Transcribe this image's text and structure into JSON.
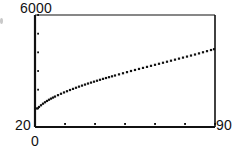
{
  "figure": {
    "name": "scatter-curve-plot",
    "background": "#ffffff",
    "ink_color": "#111111"
  },
  "axis_labels": {
    "y_max": "6000",
    "y_min": "20",
    "x_min": "0",
    "x_max": "90"
  },
  "chart_data": {
    "type": "scatter",
    "title": "",
    "xlabel": "",
    "ylabel": "",
    "xlim": [
      0,
      90
    ],
    "ylim": [
      20,
      6000
    ],
    "grid": false,
    "legend": null,
    "xticks": [
      0,
      15,
      30,
      45,
      60,
      75,
      90
    ],
    "xticklabels": [
      "0",
      "",
      "",
      "",
      "",
      "",
      "90"
    ],
    "yticks": [
      20,
      1016,
      2013,
      3010,
      4006,
      5003,
      6000
    ],
    "yticklabels": [
      "20",
      "",
      "",
      "",
      "",
      "",
      "6000"
    ],
    "marker": "dot",
    "series": [
      {
        "name": "series-1",
        "x": [
          1.0,
          2.0,
          3.0,
          4.0,
          5.0,
          6.0,
          7.0,
          8.0,
          9.0,
          10.0,
          11.5,
          13.0,
          14.5,
          16.0,
          17.5,
          19.0,
          20.5,
          22.0,
          23.5,
          25.0,
          26.5,
          28.0,
          29.5,
          31.0,
          32.5,
          34.0,
          35.5,
          37.0,
          38.5,
          40.0,
          42.0,
          44.0,
          46.0,
          48.0,
          50.0,
          52.0,
          54.0,
          56.0,
          58.0,
          60.0,
          62.0,
          64.0,
          66.0,
          68.0,
          70.0,
          72.0,
          74.0,
          76.0,
          78.0,
          80.0,
          82.0,
          84.0,
          86.0,
          88.0,
          89.5
        ],
        "y": [
          1010,
          1090,
          1180,
          1265,
          1340,
          1410,
          1475,
          1535,
          1590,
          1645,
          1720,
          1795,
          1865,
          1930,
          1995,
          2055,
          2115,
          2175,
          2230,
          2285,
          2340,
          2390,
          2440,
          2490,
          2540,
          2590,
          2635,
          2680,
          2725,
          2770,
          2830,
          2890,
          2950,
          3010,
          3065,
          3120,
          3175,
          3230,
          3285,
          3340,
          3395,
          3450,
          3505,
          3560,
          3615,
          3670,
          3725,
          3780,
          3835,
          3890,
          3950,
          4010,
          4070,
          4130,
          4175
        ]
      }
    ]
  },
  "plot_box": {
    "left": 35,
    "top": 15,
    "right": 215,
    "bottom": 127
  }
}
